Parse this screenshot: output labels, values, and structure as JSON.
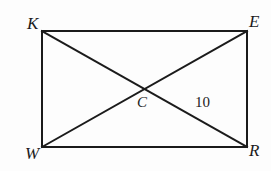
{
  "figure": {
    "background_color": "#fdfdfd",
    "stroke_color": "#1b1b1b",
    "stroke_width": 2,
    "labels": {
      "K": "K",
      "E": "E",
      "W": "W",
      "R": "R",
      "C": "C",
      "measure": "10"
    },
    "vertices": [
      {
        "name": "K",
        "label": "K",
        "x": 42,
        "y": 31,
        "position": "top-left"
      },
      {
        "name": "E",
        "label": "E",
        "x": 247,
        "y": 31,
        "position": "top-right"
      },
      {
        "name": "R",
        "label": "R",
        "x": 247,
        "y": 147,
        "position": "bottom-right"
      },
      {
        "name": "W",
        "label": "W",
        "x": 42,
        "y": 147,
        "position": "bottom-left"
      }
    ],
    "intersection": {
      "name": "C",
      "label": "C",
      "x": 144.5,
      "y": 89
    },
    "sides": [
      {
        "name": "KE",
        "from": "K",
        "to": "E"
      },
      {
        "name": "ER",
        "from": "E",
        "to": "R"
      },
      {
        "name": "RW",
        "from": "R",
        "to": "W"
      },
      {
        "name": "WK",
        "from": "W",
        "to": "K"
      }
    ],
    "diagonals": [
      {
        "name": "KR",
        "from": "K",
        "to": "R"
      },
      {
        "name": "WE",
        "from": "W",
        "to": "E"
      }
    ],
    "measurements": [
      {
        "segment": "CE",
        "value": "10",
        "label_x": 195,
        "label_y": 95
      }
    ]
  }
}
